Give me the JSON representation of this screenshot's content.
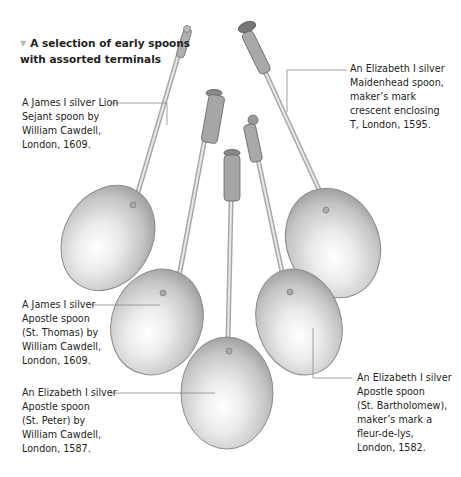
{
  "title": {
    "marker_icon": "▼",
    "text": "A selection of early spoons with assorted terminals"
  },
  "captions": [
    {
      "id": "lion-sejant",
      "text": "A James I silver Lion\nSejant spoon by\nWilliam Cawdell,\nLondon, 1609."
    },
    {
      "id": "maidenhead",
      "text": "An Elizabeth I silver\nMaidenhead spoon,\nmaker’s mark\ncrescent enclosing\nT, London, 1595."
    },
    {
      "id": "st-thomas",
      "text": "A James I silver\nApostle spoon\n(St. Thomas) by\nWilliam Cawdell,\nLondon, 1609."
    },
    {
      "id": "st-peter",
      "text": "An Elizabeth I silver\nApostle spoon\n(St. Peter) by\nWilliam Cawdell,\nLondon, 1587."
    },
    {
      "id": "st-bartholomew",
      "text": "An Elizabeth I silver\nApostle spoon\n(St. Bartholomew),\nmaker’s mark a\nfleur-de-lys,\nLondon, 1582."
    }
  ],
  "colors": {
    "text": "#231f20",
    "leader_line": "#8a8a8a",
    "marker": "#b9b9b9",
    "silver_light": "#f2f2f2",
    "silver_mid": "#c8c8c8",
    "silver_dark": "#8c8c8c"
  }
}
